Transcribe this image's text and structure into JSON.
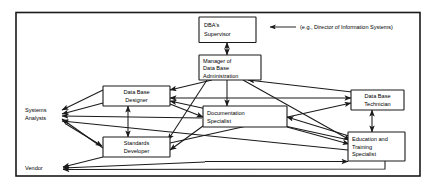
{
  "diagram": {
    "note": "(e.g., Director of Information Systems)",
    "nodes": [
      {
        "id": "dba_supervisor",
        "lines": [
          "DBA's",
          "Supervisor"
        ],
        "align": "center"
      },
      {
        "id": "manager_dba",
        "lines": [
          "Manager of",
          "Data Base",
          "Administration"
        ],
        "align": "left"
      },
      {
        "id": "data_base_designer",
        "lines": [
          "Data Base",
          "Designer"
        ],
        "align": "center"
      },
      {
        "id": "documentation_specialist",
        "lines": [
          "Documentation",
          "Specialist"
        ],
        "align": "left"
      },
      {
        "id": "data_base_technician",
        "lines": [
          "Data Base",
          "Technician"
        ],
        "align": "center"
      },
      {
        "id": "standards_developer",
        "lines": [
          "Standards",
          "Developer"
        ],
        "align": "center"
      },
      {
        "id": "education_training_specialist",
        "lines": [
          "Education and",
          "Training",
          "Specialist"
        ],
        "align": "left"
      }
    ],
    "external_labels": [
      {
        "id": "systems_analysts",
        "lines": [
          "Systems",
          "Analysts"
        ]
      },
      {
        "id": "vendor",
        "lines": [
          "Vendor"
        ]
      }
    ],
    "colors": {
      "ink": "#1a1a1a",
      "box_fill": "#ffffff",
      "background": "#ffffff"
    }
  }
}
